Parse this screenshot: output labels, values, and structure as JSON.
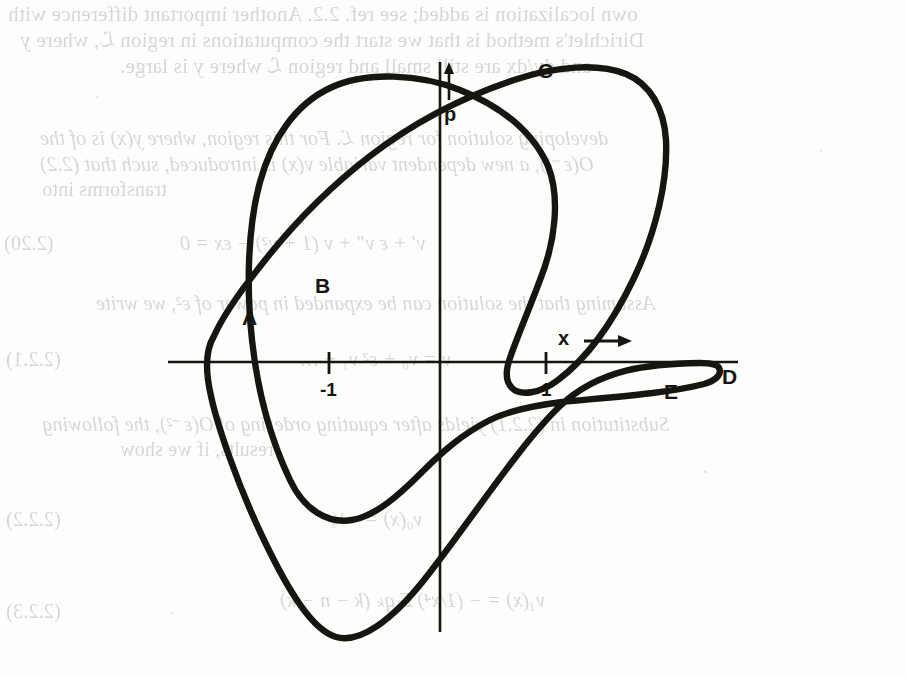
{
  "page": {
    "kind": "scanned-book-page",
    "background_color": "#fdfdfc",
    "ink_color": "#17150f",
    "bleedthrough_color": "#b9b8b6"
  },
  "figure": {
    "name": "phase-plane-hysteresis-curve",
    "axes": {
      "x_axis_label": "x",
      "x_axis_arrow": "⟶",
      "y_axis_label": "p",
      "y_axis_arrow": "↑",
      "x_ticks": [
        {
          "label": "-1",
          "value": -1
        },
        {
          "label": "1",
          "value": 1
        }
      ]
    },
    "curve_points": [
      {
        "id": "A",
        "label": "A",
        "has_overbar": false
      },
      {
        "id": "B",
        "label": "B",
        "has_overbar": false
      },
      {
        "id": "C",
        "label": "C",
        "has_overbar": false
      },
      {
        "id": "D",
        "label": "D",
        "has_overbar": false
      },
      {
        "id": "E",
        "label": "E",
        "has_overbar": false
      },
      {
        "id": "Abar",
        "label": "A",
        "has_overbar": true
      }
    ]
  },
  "bleedthrough_text": {
    "lines": [
      "own localization is added; see ref. 2.2.  Another important difference with",
      "Dirichlet's method is that we start the computations in region ℒ, where y",
      "and dy/dx are still small and region ℒ where y is large.",
      "developing solution for region ℒ.  For this region, where y(x) is of the",
      "O(ε⁻¹), a new dependent variable v(x) is introduced, such that (2.2)",
      "transforms into",
      "v′ + ε v″ + v (1 + v²) − εx = 0",
      "Assuming that the solution can be expanded in power of ε², we write",
      "v = v₀ + ε² v₁ + …",
      "Substitution in (2.2.1) yields after equating ordering of O(ε⁻²), the following",
      "results, if we show",
      "v₀(x) = −¹⁄ₓ",
      "v₁(x) = − (1/x⁴) Σ qₖ (k − n − k)"
    ],
    "equation_numbers": [
      "(2.20)",
      "(2.2.1)",
      "(2.2.2)",
      "(2.2.3)"
    ]
  }
}
